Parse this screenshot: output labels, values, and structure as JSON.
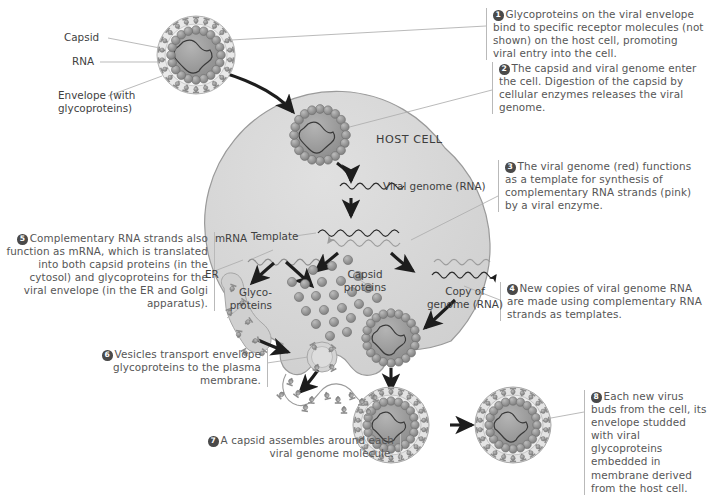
{
  "figure": {
    "background_color": "#ffffff",
    "cell_fill": "#d9d9d9",
    "cell_stroke": "#9a9a9a",
    "text_color": "#565656",
    "badge_color": "#4a4a4a",
    "rule_color": "#b9b9b9"
  },
  "steps": [
    {
      "number": "1",
      "text": "Glycoproteins on the viral envelope bind to specific receptor molecules (not shown) on the host cell, promoting viral entry into the cell.",
      "align": "left"
    },
    {
      "number": "2",
      "text": "The capsid and viral genome enter the cell. Digestion of the capsid by cellular enzymes releases the viral genome.",
      "align": "left"
    },
    {
      "number": "3",
      "text": "The viral genome (red) functions as a template for synthesis of complementary RNA strands (pink) by a viral enzyme.",
      "align": "left"
    },
    {
      "number": "4",
      "text": "New copies of viral genome RNA are made using complementary RNA strands as templates.",
      "align": "left"
    },
    {
      "number": "5",
      "text": "Complementary RNA strands also function as mRNA, which is translated into both capsid proteins (in the cytosol) and glycoproteins for the viral envelope (in the ER and Golgi apparatus).",
      "align": "right"
    },
    {
      "number": "6",
      "text": "Vesicles transport envelope glycoproteins to the plasma membrane.",
      "align": "right"
    },
    {
      "number": "7",
      "text": "A capsid assembles around each viral genome molecule.",
      "align": "right"
    },
    {
      "number": "8",
      "text": "Each new virus buds from the cell, its envelope studded with viral glycoproteins embedded in membrane derived from the host cell.",
      "align": "left"
    }
  ],
  "labels": {
    "capsid": "Capsid",
    "rna": "RNA",
    "envelope": "Envelope (with\nglycoproteins)",
    "host_cell": "HOST CELL",
    "viral_genome": "Viral genome (RNA)",
    "template": "Template",
    "mrna": "mRNA",
    "er": "ER",
    "glycoproteins": "Glyco-\nproteins",
    "capsid_proteins": "Capsid\nproteins",
    "copy_of_genome": "Copy of\ngenome (RNA)"
  }
}
